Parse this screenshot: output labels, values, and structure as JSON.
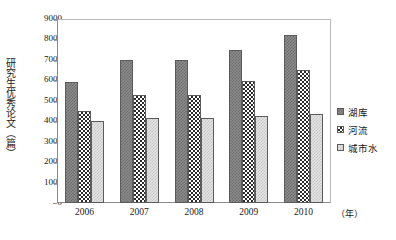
{
  "chart_data": {
    "type": "bar",
    "title": "",
    "subtitle": "",
    "xlabel": "（年）",
    "ylabel": "研究生优秀论文（篇）",
    "categories": [
      "2006",
      "2007",
      "2008",
      "2009",
      "2010"
    ],
    "series": [
      {
        "name": "湖库",
        "color": "#8a8a8a",
        "pattern": "dark-grey-checker",
        "values": [
          5900,
          7000,
          7000,
          7500,
          8200
        ]
      },
      {
        "name": "河流",
        "color": "#2b2b2b",
        "pattern": "black-white-checker",
        "values": [
          4500,
          5300,
          5300,
          5950,
          6500
        ]
      },
      {
        "name": "城市水",
        "color": "#e2e2e2",
        "pattern": "light-grey-checker",
        "values": [
          4000,
          4150,
          4150,
          4250,
          4350
        ]
      }
    ],
    "ylim": [
      0,
      9000
    ],
    "ytick_step": 1000,
    "yticks": [
      0,
      1000,
      2000,
      3000,
      4000,
      5000,
      6000,
      7000,
      8000,
      9000
    ],
    "ytick_labels": [
      "0",
      "1000",
      "2000",
      "3000",
      "4000",
      "5000",
      "6000",
      "7000",
      "8000",
      "9000"
    ],
    "grid": false,
    "legend_position": "right",
    "axis_color": "#8a8a8a",
    "frame": true
  },
  "legend": {
    "items": [
      {
        "label": "湖库"
      },
      {
        "label": "河流"
      },
      {
        "label": "城市水"
      }
    ]
  }
}
